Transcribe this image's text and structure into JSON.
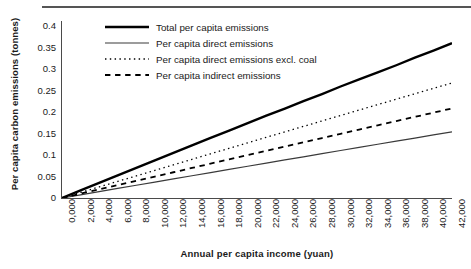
{
  "chart_data": {
    "type": "line",
    "title": "",
    "xlabel": "Annual per capita income (yuan)",
    "ylabel": "Per capita carbon emissions (tonnes)",
    "xlim": [
      0,
      42000
    ],
    "ylim": [
      0,
      0.4
    ],
    "grid": false,
    "legend_position": "top-center-inside",
    "xticks": [
      "0,000",
      "2,000",
      "4,000",
      "6,000",
      "8,000",
      "10,000",
      "12,000",
      "14,000",
      "16,000",
      "18,000",
      "20,000",
      "22,000",
      "24,000",
      "26,000",
      "28,000",
      "30,000",
      "32,000",
      "34,000",
      "36,000",
      "38,000",
      "40,000",
      "42,000"
    ],
    "yticks": [
      "0",
      "0.05",
      "0.1",
      "0.15",
      "0.2",
      "0.25",
      "0.3",
      "0.35",
      "0.4"
    ],
    "x": [
      0,
      2000,
      4000,
      6000,
      8000,
      10000,
      12000,
      14000,
      16000,
      18000,
      20000,
      22000,
      24000,
      26000,
      28000,
      30000,
      32000,
      34000,
      36000,
      38000,
      40000,
      42000
    ],
    "series": [
      {
        "name": "Total per capita emissions",
        "style": "solid",
        "width": 2.4,
        "color": "#000000",
        "values": [
          0,
          0.017,
          0.034,
          0.051,
          0.068,
          0.085,
          0.102,
          0.119,
          0.136,
          0.152,
          0.169,
          0.186,
          0.202,
          0.219,
          0.235,
          0.252,
          0.268,
          0.284,
          0.3,
          0.317,
          0.333,
          0.35
        ]
      },
      {
        "name": "Per capita direct emissions",
        "style": "solid",
        "width": 1.2,
        "color": "#3a3a3a",
        "values": [
          0,
          0.0072,
          0.0144,
          0.0216,
          0.0288,
          0.036,
          0.0432,
          0.0503,
          0.0575,
          0.0646,
          0.0718,
          0.0789,
          0.086,
          0.0931,
          0.1002,
          0.1073,
          0.1143,
          0.1214,
          0.1284,
          0.1355,
          0.1425,
          0.1495
        ]
      },
      {
        "name": "Per capita direct emissions excl. coal",
        "style": "dotted",
        "width": 1.3,
        "color": "#000000",
        "values": [
          0,
          0.0125,
          0.025,
          0.0375,
          0.05,
          0.0625,
          0.075,
          0.0874,
          0.0999,
          0.1123,
          0.1247,
          0.1371,
          0.1495,
          0.1618,
          0.1742,
          0.1865,
          0.1988,
          0.2111,
          0.2233,
          0.2356,
          0.2478,
          0.26
        ]
      },
      {
        "name": "Per capita indirect emissions",
        "style": "dashed",
        "width": 1.8,
        "color": "#000000",
        "values": [
          0,
          0.0097,
          0.0194,
          0.0291,
          0.0388,
          0.0485,
          0.0582,
          0.0679,
          0.0776,
          0.0872,
          0.0969,
          0.1065,
          0.1162,
          0.1258,
          0.1354,
          0.145,
          0.1546,
          0.1642,
          0.1738,
          0.1833,
          0.1929,
          0.2024
        ]
      }
    ]
  }
}
